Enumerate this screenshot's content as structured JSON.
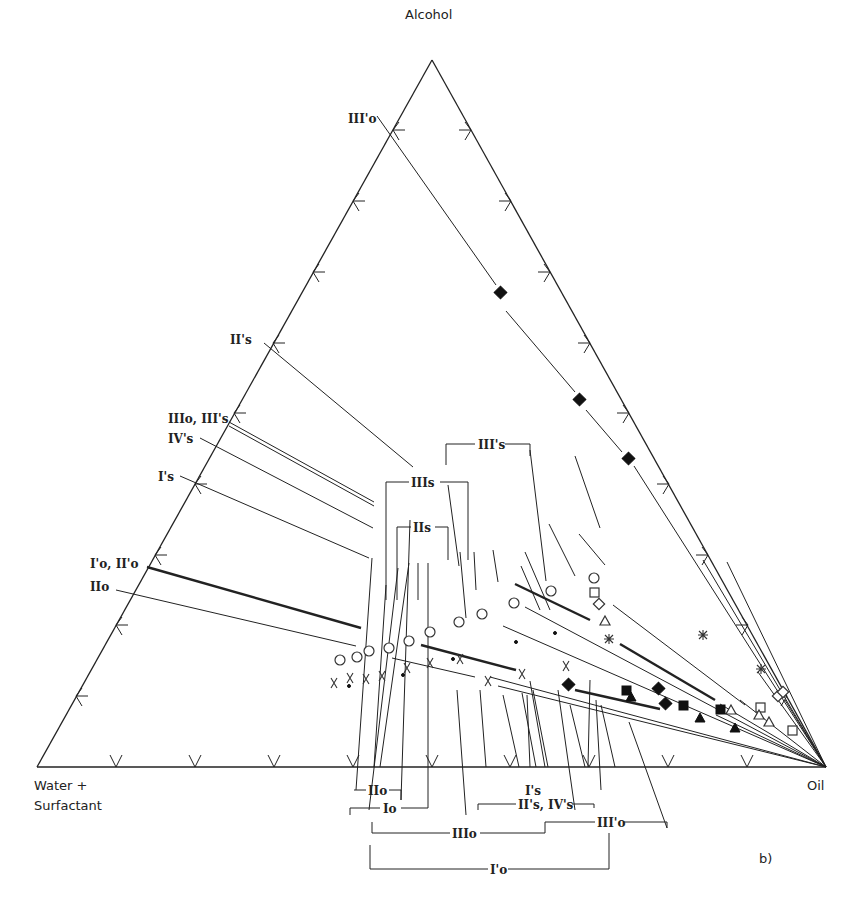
{
  "diagram": {
    "vertices": {
      "top": "Alcohol",
      "bottom_left_line1": "Water +",
      "bottom_left_line2": "Surfactant",
      "bottom_right": "Oil"
    },
    "panel_label": "b)",
    "line_labels_left": [
      {
        "id": "III'o",
        "text": "III'o"
      },
      {
        "id": "II's",
        "text": "II's"
      },
      {
        "id": "IIIo, III's",
        "text": "IIIo, III's"
      },
      {
        "id": "IV's",
        "text": "IV's"
      },
      {
        "id": "I's",
        "text": "I's"
      },
      {
        "id": "I'o, II'o",
        "text": "I'o, II'o"
      },
      {
        "id": "IIo",
        "text": "IIo"
      }
    ],
    "bracket_labels_top": [
      {
        "text": "III's"
      },
      {
        "text": "IIIs"
      },
      {
        "text": "IIs"
      }
    ],
    "bracket_labels_bottom": [
      {
        "text": "IIo"
      },
      {
        "text": "Io"
      },
      {
        "text": "I's"
      },
      {
        "text": "II's, IV's"
      },
      {
        "text": "III'o"
      },
      {
        "text": "IIIo"
      },
      {
        "text": "I'o"
      }
    ],
    "marker_types": [
      "open-circle",
      "x-cross",
      "dot",
      "filled-diamond",
      "open-square",
      "open-diamond",
      "open-triangle",
      "asterisk",
      "filled-square",
      "filled-triangle"
    ]
  }
}
